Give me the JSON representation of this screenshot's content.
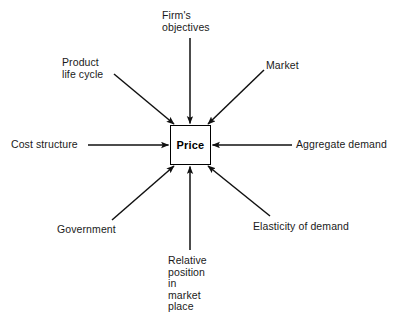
{
  "diagram": {
    "center": {
      "label": "Price",
      "shape": "rectangle"
    },
    "line_color": "#111111",
    "text_color": "#1a1a1a",
    "background": "#ffffff",
    "factors": [
      {
        "id": "firms-objectives",
        "label": "Firm's\nobjectives",
        "lines": [
          "Firm's",
          "objectives"
        ],
        "direction": "top",
        "arrow": "down-into-center"
      },
      {
        "id": "product-life-cycle",
        "label": "Product\nlife cycle",
        "lines": [
          "Product",
          "life cycle"
        ],
        "direction": "top-left",
        "arrow": "diagonal-into-center"
      },
      {
        "id": "market",
        "label": "Market",
        "lines": [
          "Market"
        ],
        "direction": "top-right",
        "arrow": "diagonal-into-center"
      },
      {
        "id": "cost-structure",
        "label": "Cost structure",
        "lines": [
          "Cost structure"
        ],
        "direction": "left",
        "arrow": "right-into-center"
      },
      {
        "id": "aggregate-demand",
        "label": "Aggregate demand",
        "lines": [
          "Aggregate demand"
        ],
        "direction": "right",
        "arrow": "left-into-center"
      },
      {
        "id": "government",
        "label": "Government",
        "lines": [
          "Government"
        ],
        "direction": "bottom-left",
        "arrow": "diagonal-into-center"
      },
      {
        "id": "elasticity-of-demand",
        "label": "Elasticity of demand",
        "lines": [
          "Elasticity of demand"
        ],
        "direction": "bottom-right",
        "arrow": "diagonal-into-center"
      },
      {
        "id": "relative-position-in-market-place",
        "label": "Relative\nposition\nin\nmarket\nplace",
        "lines": [
          "Relative",
          "position",
          "in",
          "market",
          "place"
        ],
        "direction": "bottom",
        "arrow": "up-into-center"
      }
    ]
  }
}
